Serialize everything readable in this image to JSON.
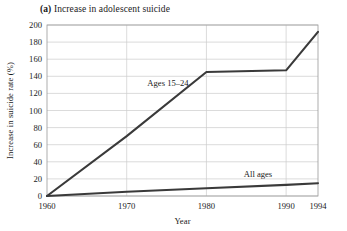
{
  "figure": {
    "panel_tag": "(a)",
    "title": "Increase in adolescent suicide"
  },
  "chart_data": {
    "type": "line",
    "title": "(a) Increase in adolescent suicide",
    "xlabel": "Year",
    "ylabel": "Increase in suicide rate (%)",
    "xlim": [
      1960,
      1994
    ],
    "ylim": [
      0,
      200
    ],
    "xticks": [
      1960,
      1970,
      1980,
      1990,
      1994
    ],
    "xtick_labels": [
      "1960",
      "1970",
      "1980",
      "1990",
      "1994"
    ],
    "yticks": [
      0,
      20,
      40,
      60,
      80,
      100,
      120,
      140,
      160,
      180,
      200
    ],
    "ytick_labels": [
      "0",
      "20",
      "40",
      "60",
      "80",
      "100",
      "120",
      "140",
      "160",
      "180",
      "200"
    ],
    "grid": "both",
    "legend": "inline-labels",
    "line_color": "#3a3a3a",
    "grid_color": "#cccccc",
    "frame_color": "#9a9a9a",
    "series": [
      {
        "name": "Ages 15–24",
        "label": "Ages 15–24",
        "x": [
          1960,
          1970,
          1980,
          1990,
          1994
        ],
        "values": [
          0,
          70,
          145,
          147,
          192
        ]
      },
      {
        "name": "All ages",
        "label": "All ages",
        "x": [
          1960,
          1970,
          1980,
          1990,
          1994
        ],
        "values": [
          0,
          5,
          9,
          13,
          15
        ]
      }
    ]
  }
}
